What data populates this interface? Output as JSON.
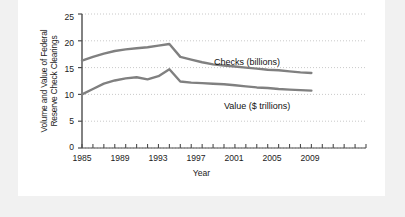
{
  "figure": {
    "background_color": "#f1f1f1",
    "panel_color": "#ffffff",
    "line_color": "#808080",
    "axis_color": "#4d4d4d",
    "grid_color": "#b3b3b3",
    "text_color": "#1c1c1c"
  },
  "chart_data": {
    "type": "line",
    "title": "",
    "xlabel": "Year",
    "ylabel": "Volume and Value of Federal\nReserve Check Clearings",
    "xlim": [
      1985,
      2011
    ],
    "ylim": [
      0,
      25
    ],
    "yticks": [
      0,
      5,
      10,
      15,
      20,
      25
    ],
    "ytick_labels": [
      "0",
      "5",
      "10",
      "15",
      "20",
      "25"
    ],
    "xticks": [
      1985,
      1986,
      1987,
      1988,
      1989,
      1990,
      1991,
      1992,
      1993,
      1994,
      1995,
      1996,
      1997,
      1998,
      1999,
      2000,
      2001,
      2002,
      2003,
      2004,
      2005,
      2006,
      2007,
      2008,
      2009,
      2010,
      2011
    ],
    "xtick_labels_shown": [
      "1985",
      "1989",
      "1993",
      "1997",
      "2001",
      "2005",
      "2009"
    ],
    "xtick_labels_values": [
      1985,
      1989,
      1993,
      1997,
      2001,
      2005,
      2009
    ],
    "grid": "horizontal-dotted",
    "legend_position": "inline-annotation",
    "x": [
      1985,
      1986,
      1987,
      1988,
      1989,
      1990,
      1991,
      1992,
      1993,
      1994,
      1995,
      1996,
      1997,
      1998,
      1999,
      2000,
      2001,
      2002,
      2003,
      2004,
      2005,
      2006
    ],
    "series": [
      {
        "name": "Checks (billions)",
        "label": "Checks (billions)",
        "values": [
          16.3,
          17.0,
          17.6,
          18.1,
          18.4,
          18.6,
          18.8,
          19.1,
          19.4,
          17.0,
          16.5,
          16.0,
          15.6,
          15.4,
          15.2,
          15.0,
          14.8,
          14.6,
          14.5,
          14.3,
          14.1,
          14.0
        ]
      },
      {
        "name": "Value ($ trillions)",
        "label": "Value ($ trillions)",
        "values": [
          10.0,
          11.0,
          12.0,
          12.6,
          13.0,
          13.2,
          12.8,
          13.4,
          14.7,
          12.4,
          12.2,
          12.1,
          12.0,
          11.9,
          11.7,
          11.5,
          11.3,
          11.2,
          11.0,
          10.9,
          10.8,
          10.7
        ]
      }
    ],
    "annotations": [
      {
        "text": "Checks (billions)",
        "x": 1997,
        "y": 17.2
      },
      {
        "text": "Value ($ trillions)",
        "x": 1999,
        "y": 7.8
      }
    ]
  }
}
